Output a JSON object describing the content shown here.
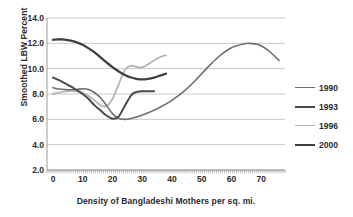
{
  "chart_data": {
    "type": "line",
    "title": "",
    "xlabel": "Density of Bangladeshi Mothers per sq. mi.",
    "ylabel": "Smoothed LBW Percent",
    "xlim": [
      -2,
      78
    ],
    "ylim": [
      2.0,
      14.0
    ],
    "grid": true,
    "legend_position": "right",
    "y_ticks": [
      "14.0",
      "12.0",
      "10.0",
      "8.0",
      "6.0",
      "4.0",
      "2.0"
    ],
    "y_tick_values": [
      14.0,
      12.0,
      10.0,
      8.0,
      6.0,
      4.0,
      2.0
    ],
    "x_ticks": [
      "0",
      "10",
      "20",
      "30",
      "40",
      "50",
      "60",
      "70"
    ],
    "x_tick_values": [
      0,
      10,
      20,
      30,
      40,
      50,
      60,
      70
    ],
    "series": [
      {
        "name": "1990",
        "color": "#6e6e6e",
        "width": 1.6,
        "x": [
          0,
          2,
          4,
          6,
          8,
          10,
          12,
          14,
          16,
          18,
          20,
          22,
          24,
          26,
          28,
          30,
          33,
          36,
          40,
          44,
          48,
          52,
          56,
          60,
          64,
          66,
          69,
          72,
          74,
          76
        ],
        "y": [
          8.5,
          8.4,
          8.35,
          8.33,
          8.36,
          8.42,
          8.35,
          8.1,
          7.7,
          7.1,
          6.45,
          6.08,
          6.0,
          6.05,
          6.18,
          6.35,
          6.62,
          6.95,
          7.5,
          8.2,
          9.1,
          10.1,
          11.0,
          11.65,
          11.95,
          12.0,
          11.9,
          11.5,
          11.1,
          10.65
        ]
      },
      {
        "name": "1993",
        "color": "#4a4a4a",
        "width": 2.0,
        "x": [
          0,
          2,
          4,
          6,
          8,
          10,
          12,
          14,
          16,
          18,
          20,
          22,
          24,
          26,
          27,
          28,
          29,
          30,
          31,
          32,
          33,
          34
        ],
        "y": [
          9.3,
          9.1,
          8.85,
          8.6,
          8.3,
          8.0,
          7.6,
          7.1,
          6.7,
          6.3,
          6.05,
          6.2,
          7.0,
          7.8,
          8.05,
          8.15,
          8.2,
          8.22,
          8.22,
          8.22,
          8.22,
          8.22
        ]
      },
      {
        "name": "1996",
        "color": "#b5b5b5",
        "width": 1.8,
        "x": [
          0,
          2,
          4,
          6,
          8,
          10,
          12,
          14,
          16,
          18,
          20,
          22,
          23,
          24,
          25,
          26,
          27,
          28,
          29,
          30,
          31,
          32,
          33,
          34,
          35,
          36,
          37,
          38
        ],
        "y": [
          8.0,
          8.1,
          8.2,
          8.25,
          8.2,
          8.1,
          7.85,
          7.5,
          7.1,
          7.05,
          7.6,
          8.7,
          9.3,
          9.8,
          10.1,
          10.2,
          10.22,
          10.15,
          10.1,
          10.1,
          10.2,
          10.35,
          10.5,
          10.65,
          10.8,
          10.92,
          11.0,
          11.05
        ]
      },
      {
        "name": "2000",
        "color": "#404040",
        "width": 2.3,
        "x": [
          0,
          2,
          4,
          6,
          8,
          10,
          12,
          14,
          16,
          18,
          20,
          22,
          24,
          26,
          28,
          30,
          32,
          34,
          36,
          38
        ],
        "y": [
          12.28,
          12.32,
          12.3,
          12.22,
          12.08,
          11.88,
          11.6,
          11.28,
          10.9,
          10.5,
          10.12,
          9.8,
          9.52,
          9.32,
          9.2,
          9.15,
          9.2,
          9.3,
          9.45,
          9.6
        ]
      }
    ]
  },
  "legend": {
    "items": [
      {
        "label": "1990",
        "color": "#6e6e6e",
        "width": 1.6
      },
      {
        "label": "1993",
        "color": "#4a4a4a",
        "width": 2.2
      },
      {
        "label": "1996",
        "color": "#b5b5b5",
        "width": 1.8
      },
      {
        "label": "2000",
        "color": "#404040",
        "width": 2.6
      }
    ]
  },
  "style": {
    "grid_color": "#c9c9c9",
    "axis_color": "#9a9a9a",
    "text_color": "#2b2b2b",
    "background": "#ffffff"
  }
}
